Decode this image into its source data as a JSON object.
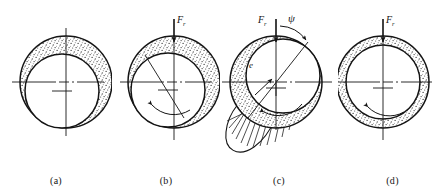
{
  "figure": {
    "background_color": "#ffffff",
    "ink_color": "#141414",
    "stipple_color": "#3a3a3a",
    "panel_count": 4
  },
  "symbols": {
    "force_letter": "F",
    "force_subscript": "r",
    "attitude_angle": "ψ",
    "eccentricity": "e"
  },
  "panels": [
    {
      "id": "a",
      "caption": "(a)",
      "state_label": "rest",
      "load_label_visible": false,
      "angle_label_visible": false,
      "eccentricity_label_visible": false,
      "rotation_arrow": false,
      "pressure_lobe": false,
      "bearing": {
        "cx": 66,
        "cy": 82,
        "r": 46
      },
      "journal": {
        "cx": 62,
        "cy": 91,
        "r": 37
      }
    },
    {
      "id": "b",
      "caption": "(b)",
      "state_label": "starting",
      "load_label_visible": true,
      "angle_label_visible": false,
      "eccentricity_label_visible": false,
      "rotation_arrow": true,
      "pressure_lobe": false,
      "bearing": {
        "cx": 174,
        "cy": 82,
        "r": 46
      },
      "journal": {
        "cx": 168,
        "cy": 90,
        "r": 37
      }
    },
    {
      "id": "c",
      "caption": "(c)",
      "state_label": "hydrodynamic",
      "load_label_visible": true,
      "angle_label_visible": true,
      "eccentricity_label_visible": true,
      "rotation_arrow": true,
      "pressure_lobe": true,
      "bearing": {
        "cx": 276,
        "cy": 82,
        "r": 46
      },
      "journal": {
        "cx": 283,
        "cy": 76,
        "r": 37
      }
    },
    {
      "id": "d",
      "caption": "(d)",
      "state_label": "concentric",
      "load_label_visible": true,
      "angle_label_visible": false,
      "eccentricity_label_visible": false,
      "rotation_arrow": true,
      "pressure_lobe": false,
      "bearing": {
        "cx": 383,
        "cy": 82,
        "r": 46
      },
      "journal": {
        "cx": 383,
        "cy": 82,
        "r": 37
      }
    }
  ]
}
